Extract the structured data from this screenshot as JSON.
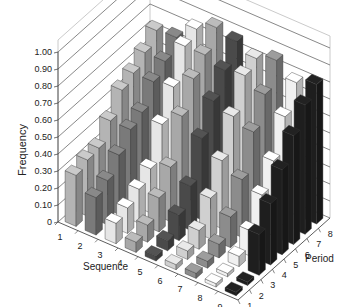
{
  "chart_data": {
    "type": "bar",
    "subtype": "3d-bar",
    "title": "",
    "ylabel": "Frequency",
    "xlabel": "Sequence",
    "zlabel": "Period",
    "ylim": [
      0,
      1.0
    ],
    "yticks": [
      "0",
      "0.10",
      "0.20",
      "0.30",
      "0.40",
      "0.50",
      "0.60",
      "0.70",
      "0.80",
      "0.90",
      "1.00"
    ],
    "sequence_categories": [
      "1",
      "2",
      "3",
      "4",
      "5",
      "6",
      "7",
      "8",
      "9"
    ],
    "period_categories": [
      "1",
      "2",
      "3",
      "4",
      "5",
      "6",
      "7",
      "8"
    ],
    "grid": true,
    "series": [
      {
        "name": "Sequence 1",
        "color": "#b4b4b4",
        "values": [
          0.3,
          0.33,
          0.34,
          0.44,
          0.56,
          0.6,
          0.66,
          0.73
        ]
      },
      {
        "name": "Sequence 2",
        "color": "#7a7a7a",
        "values": [
          0.22,
          0.26,
          0.35,
          0.44,
          0.48,
          0.6,
          0.66,
          0.74
        ]
      },
      {
        "name": "Sequence 3",
        "color": "#e6e6e6",
        "values": [
          0.12,
          0.15,
          0.2,
          0.26,
          0.46,
          0.62,
          0.8,
          0.84
        ]
      },
      {
        "name": "Sequence 4",
        "color": "#a8a8a8",
        "values": [
          0.06,
          0.1,
          0.2,
          0.32,
          0.56,
          0.72,
          0.8,
          0.9
        ]
      },
      {
        "name": "Sequence 5",
        "color": "#4a4a4a",
        "values": [
          0.03,
          0.06,
          0.15,
          0.26,
          0.48,
          0.64,
          0.76,
          0.87
        ]
      },
      {
        "name": "Sequence 6",
        "color": "#d0d0d0",
        "values": [
          0.03,
          0.05,
          0.11,
          0.24,
          0.4,
          0.6,
          0.78,
          0.82
        ]
      },
      {
        "name": "Sequence 7",
        "color": "#8c8c8c",
        "values": [
          0.03,
          0.04,
          0.08,
          0.18,
          0.34,
          0.56,
          0.72,
          0.86
        ]
      },
      {
        "name": "Sequence 8",
        "color": "#f0f0f0",
        "values": [
          0.02,
          0.02,
          0.06,
          0.15,
          0.3,
          0.44,
          0.64,
          0.78
        ]
      },
      {
        "name": "Sequence 9",
        "color": "#1e1e1e",
        "values": [
          0.02,
          0.02,
          0.24,
          0.36,
          0.5,
          0.64,
          0.76,
          0.82
        ]
      }
    ],
    "axis_labels": {
      "y": "Frequency",
      "sequence": "Sequence",
      "period": "Period"
    }
  }
}
